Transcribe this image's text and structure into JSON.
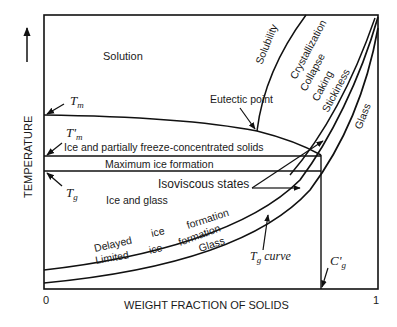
{
  "diagram": {
    "type": "state diagram",
    "axes": {
      "y_label": "TEMPERATURE",
      "x_label": "WEIGHT FRACTION OF SOLIDS",
      "x_min_label": "0",
      "x_max_label": "1"
    },
    "point_labels": {
      "tm": "T",
      "tm_sub": "m",
      "tm_prime": "T'",
      "tm_prime_sub": "m",
      "tg": "T",
      "tg_sub": "g",
      "cg": "C'",
      "cg_sub": "g",
      "tg_curve_main": "T",
      "tg_curve_sub": "g",
      "tg_curve_suffix": " curve"
    },
    "regions": {
      "solution": "Solution",
      "eutectic_point": "Eutectic point",
      "partially_frozen": "Ice and partially freeze-concentrated solids",
      "max_ice": "Maximum ice formation",
      "isoviscous": "Isoviscous states",
      "ice_and_glass": "Ice and glass",
      "glass_lower": "Glass",
      "glass_upper": "Glass"
    },
    "curve_labels": {
      "solubility": "Solubility",
      "crystallization": "Crystallization",
      "collapse": "Collapse",
      "caking": "Caking",
      "stickiness": "Stickiness"
    },
    "band_labels": {
      "delayed": "Delayed",
      "delayed_ice": "ice",
      "delayed_formation": "formation",
      "limited": "Limited",
      "limited_ice": "ice",
      "limited_formation": "formation"
    }
  }
}
